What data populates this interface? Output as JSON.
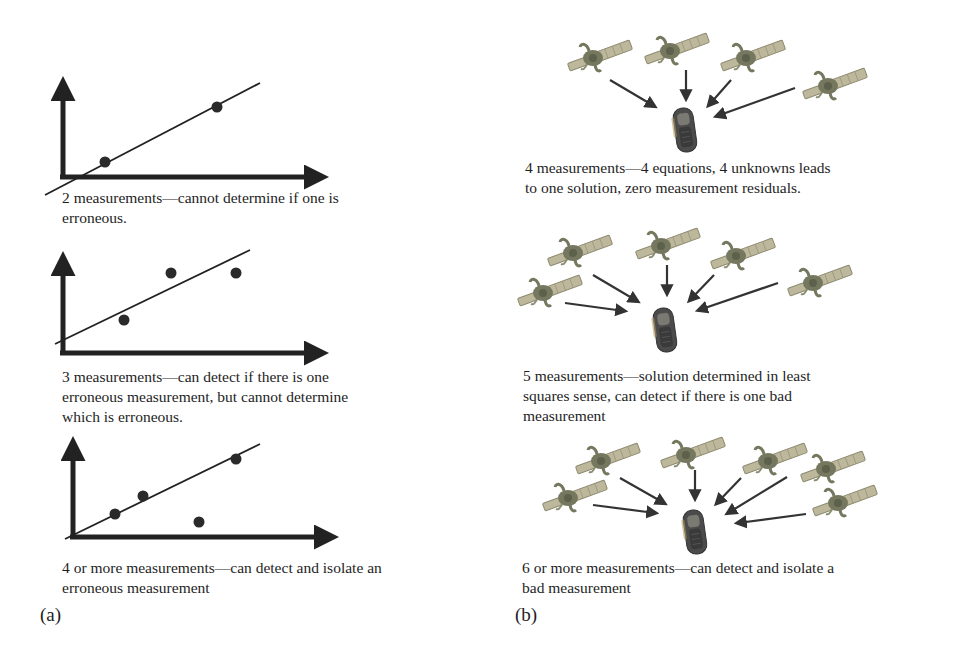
{
  "figure": {
    "panel_a": {
      "label": "(a)",
      "plots": [
        {
          "caption_lines": [
            "2 measurements—cannot determine if one is",
            "erroneous."
          ],
          "points": [
            [
              105,
              162
            ],
            [
              217,
              107
            ]
          ],
          "outliers": []
        },
        {
          "caption_lines": [
            "3 measurements—can detect if there is one",
            "erroneous measurement, but cannot determine",
            "which is erroneous."
          ],
          "points": [
            [
              124,
              320
            ],
            [
              171,
              273
            ],
            [
              236,
              273
            ]
          ],
          "outliers": []
        },
        {
          "caption_lines": [
            "4 or more measurements—can detect and isolate an",
            "erroneous measurement"
          ],
          "points": [
            [
              115,
              514
            ],
            [
              143,
              496
            ],
            [
              236,
              459
            ]
          ],
          "outliers": [
            [
              199,
              522
            ]
          ]
        }
      ]
    },
    "panel_b": {
      "label": "(b)",
      "scenes": [
        {
          "caption_lines": [
            "4 measurements—4 equations, 4 unknowns leads",
            "to one solution, zero measurement residuals."
          ],
          "satellite_count": 4
        },
        {
          "caption_lines": [
            "5 measurements—solution determined in least",
            "squares sense, can detect if there is one bad",
            "measurement"
          ],
          "satellite_count": 5
        },
        {
          "caption_lines": [
            "6 or more measurements—can detect and isolate a",
            "bad measurement"
          ],
          "satellite_count": 6
        }
      ]
    },
    "icons": {
      "satellite": "satellite-icon",
      "receiver": "gps-receiver-icon",
      "axis_arrow": "arrow-icon",
      "signal_arrow": "signal-arrow-icon"
    },
    "colors": {
      "ink": "#1e1e1e",
      "axis": "#222222",
      "satellite_body": "#7d8068",
      "satellite_panel": "#b9b59a",
      "receiver": "#4a4a4a",
      "background": "#ffffff"
    }
  }
}
